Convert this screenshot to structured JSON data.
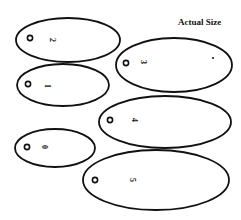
{
  "caption": "Actual Size",
  "colors": {
    "stroke": "#111111",
    "background": "#ffffff"
  },
  "shapes": [
    {
      "label": "2",
      "cx": 68,
      "cy": 40,
      "rx": 52,
      "ry": 22,
      "hole_x": 30,
      "hole_y": 38,
      "label_x": 52,
      "label_y": 40
    },
    {
      "label": "1",
      "cx": 63,
      "cy": 85,
      "rx": 46,
      "ry": 21,
      "hole_x": 28,
      "hole_y": 84,
      "label_x": 47,
      "label_y": 86
    },
    {
      "label": "3",
      "cx": 174,
      "cy": 65,
      "rx": 58,
      "ry": 27,
      "hole_x": 126,
      "hole_y": 63,
      "label_x": 143,
      "label_y": 62,
      "dot_x": 213,
      "dot_y": 58
    },
    {
      "label": "4",
      "cx": 165,
      "cy": 122,
      "rx": 66,
      "ry": 26,
      "hole_x": 110,
      "hole_y": 120,
      "label_x": 134,
      "label_y": 120
    },
    {
      "label": "0",
      "cx": 55,
      "cy": 148,
      "rx": 40,
      "ry": 19,
      "hole_x": 27,
      "hole_y": 147,
      "label_x": 44,
      "label_y": 147
    },
    {
      "label": "5",
      "cx": 156,
      "cy": 180,
      "rx": 73,
      "ry": 30,
      "hole_x": 95,
      "hole_y": 180,
      "label_x": 132,
      "label_y": 180
    }
  ]
}
